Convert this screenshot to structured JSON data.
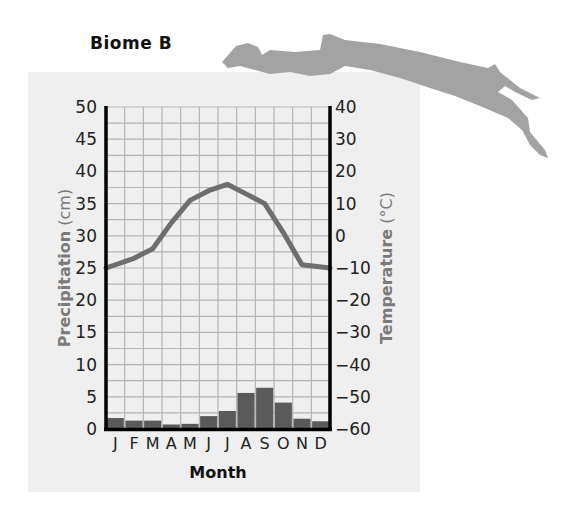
{
  "title": "Biome B",
  "colors": {
    "panel": "#efefef",
    "grid": "#b4b4b4",
    "bars": "#5a5a5a",
    "line": "#6e6e6e",
    "axis": "#000000",
    "map": "#a3a3a3"
  },
  "chart_data": {
    "type": "bar+line",
    "title": "Biome B",
    "xlabel": "Month",
    "ylabel_left": "Precipitation (cm)",
    "ylabel_right": "Temperature (°C)",
    "categories": [
      "J",
      "F",
      "M",
      "A",
      "M",
      "J",
      "J",
      "A",
      "S",
      "O",
      "N",
      "D"
    ],
    "series": [
      {
        "name": "Precipitation (cm)",
        "type": "bar",
        "axis": "left",
        "values": [
          1.7,
          1.3,
          1.3,
          0.7,
          0.8,
          2.0,
          2.8,
          5.6,
          6.4,
          4.1,
          1.6,
          1.2
        ]
      },
      {
        "name": "Temperature (°C)",
        "type": "line",
        "axis": "right",
        "values": [
          -10,
          -7,
          -4,
          4,
          11,
          14,
          16,
          13,
          10,
          1,
          -9,
          -10
        ]
      }
    ],
    "ylim_left": [
      0,
      50
    ],
    "yticks_left": [
      0,
      5,
      10,
      15,
      20,
      25,
      30,
      35,
      40,
      45,
      50
    ],
    "ylim_right": [
      -60,
      40
    ],
    "yticks_right": [
      -60,
      -50,
      -40,
      -30,
      -20,
      -10,
      0,
      10,
      20,
      30,
      40
    ],
    "grid": true
  },
  "axes": {
    "left_ticks": [
      "50",
      "45",
      "40",
      "35",
      "30",
      "25",
      "20",
      "15",
      "10",
      "5",
      "0"
    ],
    "right_ticks": [
      "40",
      "30",
      "20",
      "10",
      "0",
      "−10",
      "−20",
      "−30",
      "−40",
      "−50",
      "−60"
    ],
    "months": [
      "J",
      "F",
      "M",
      "A",
      "M",
      "J",
      "J",
      "A",
      "S",
      "O",
      "N",
      "D"
    ],
    "xlabel": "Month",
    "ylabel_left_bold": "Precipitation",
    "ylabel_left_unit": " (cm)",
    "ylabel_right_bold": "Temperature",
    "ylabel_right_unit": " (°C)"
  }
}
